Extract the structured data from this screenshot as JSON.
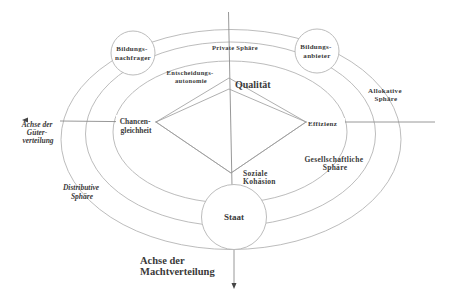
{
  "diagram": {
    "nodes": {
      "demander": [
        "Bildungs-",
        "nachfrager"
      ],
      "provider": [
        "Bildungs-",
        "anbieter"
      ],
      "state": "Staat"
    },
    "spheres": {
      "private": "Private Sphäre",
      "allocative": [
        "Allokative",
        "Sphäre"
      ],
      "social": [
        "Gesellschaftliche",
        "Sphäre"
      ],
      "distributive": [
        "Distributive",
        "Sphäre"
      ]
    },
    "criteria": {
      "autonomy": [
        "Entscheidungs-",
        "autonomie"
      ],
      "quality": "Qualität",
      "equity": [
        "Chancen-",
        "gleichheit"
      ],
      "efficiency": "Effizienz",
      "cohesion": [
        "Soziale",
        "Kohäsion"
      ]
    },
    "axes": {
      "goods_distribution": [
        "Achse der",
        "Güter-",
        "verteilung"
      ],
      "power_distribution": [
        "Achse der",
        "Machtverteilung"
      ]
    },
    "colors": {
      "lines": "#b4b4b4",
      "text": "#3a3a3a",
      "background": "#ffffff"
    }
  }
}
